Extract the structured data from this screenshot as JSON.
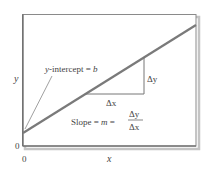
{
  "diagram": {
    "type": "linear-function-slope-intercept",
    "axis": {
      "y_label": "y",
      "x_label": "x",
      "y_origin_label": "0",
      "x_origin_label": "0"
    },
    "annotations": {
      "intercept": {
        "prefix": "y",
        "middle": "-intercept = ",
        "suffix": "b"
      },
      "delta_y": "Δy",
      "delta_x": "Δx",
      "slope": {
        "prefix": "Slope = ",
        "m": "m",
        "eq": " = ",
        "numerator": "Δy",
        "denominator": "Δx"
      }
    },
    "colors": {
      "line": "#7a7a7a",
      "frame": "#8a8a8a",
      "shadow": "#b5b5b5",
      "text": "#444444"
    }
  }
}
